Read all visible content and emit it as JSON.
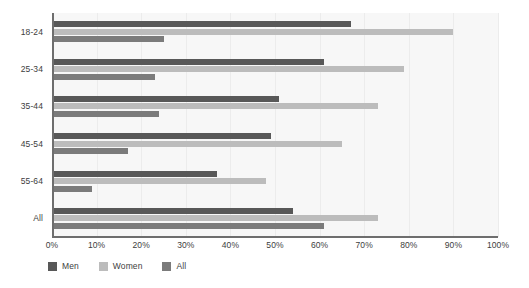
{
  "chart_data": {
    "type": "bar",
    "orientation": "horizontal",
    "title": "",
    "subtitle": "",
    "xlabel": "",
    "ylabel": "",
    "xlim": [
      0,
      100
    ],
    "xticks": [
      0,
      10,
      20,
      30,
      40,
      50,
      60,
      70,
      80,
      90,
      100
    ],
    "xtick_labels": [
      "0%",
      "10%",
      "20%",
      "30%",
      "40%",
      "50%",
      "60%",
      "70%",
      "80%",
      "90%",
      "100%"
    ],
    "categories": [
      "18-24",
      "25-34",
      "35-44",
      "45-54",
      "55-64",
      "All"
    ],
    "grid": true,
    "grid_axis": "x",
    "legend_position": "bottom-left",
    "series": [
      {
        "name": "Men",
        "color": "#585858",
        "values": [
          67,
          61,
          51,
          49,
          37,
          54
        ]
      },
      {
        "name": "Women",
        "color": "#bcbcbc",
        "values": [
          90,
          79,
          73,
          65,
          48,
          73
        ]
      },
      {
        "name": "All",
        "color": "#7b7b7b",
        "values": [
          25,
          23,
          24,
          17,
          9,
          61
        ]
      }
    ]
  },
  "legend": {
    "items": [
      {
        "label": "Men",
        "color": "#585858"
      },
      {
        "label": "Women",
        "color": "#bcbcbc"
      },
      {
        "label": "All",
        "color": "#7b7b7b"
      }
    ]
  },
  "colors": {
    "plot_background": "#f7f7f7",
    "gridline": "#ececec",
    "axis": "#6e6e6e",
    "text": "#3d3d3d",
    "page_background": "#ffffff"
  }
}
